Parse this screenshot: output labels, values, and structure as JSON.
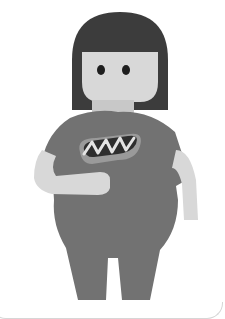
{
  "illustration": {
    "subject": "person-holding-hot-dog",
    "caption_partial": "",
    "colors": {
      "hair": "#3c3c3c",
      "skin": "#d8d8d8",
      "shirt": "#727272",
      "eyes": "#1e1e1e",
      "bun": "#9a9a9a",
      "sausage": "#2e2e2e",
      "mustard": "#e4e4e4",
      "border": "#d6d6d6"
    }
  }
}
